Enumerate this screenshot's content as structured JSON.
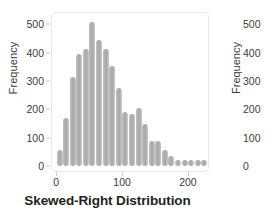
{
  "chart_data": {
    "type": "bar",
    "title": "Skewed-Right Distribution",
    "xlabel": "",
    "ylabel": "Frequency",
    "xlim": [
      -8,
      232
    ],
    "ylim": [
      0,
      530
    ],
    "grid": false,
    "legend": null,
    "bin_width": 10,
    "x": [
      5,
      15,
      25,
      35,
      45,
      55,
      65,
      75,
      85,
      95,
      105,
      115,
      125,
      135,
      145,
      155,
      165,
      175,
      185,
      195,
      205,
      215,
      225
    ],
    "values": [
      55,
      168,
      315,
      395,
      415,
      510,
      445,
      415,
      355,
      275,
      190,
      185,
      205,
      148,
      88,
      88,
      55,
      35,
      22,
      15,
      15,
      15,
      15
    ],
    "x_ticks": [
      {
        "value": 0,
        "label": "0"
      },
      {
        "value": 100,
        "label": "100"
      },
      {
        "value": 200,
        "label": "200"
      }
    ],
    "y_ticks": [
      {
        "value": 0,
        "label": "0"
      },
      {
        "value": 100,
        "label": "100"
      },
      {
        "value": 200,
        "label": "200"
      },
      {
        "value": 300,
        "label": "300"
      },
      {
        "value": 400,
        "label": "400"
      },
      {
        "value": 500,
        "label": "500"
      }
    ],
    "bar_color": "#b3b3b3",
    "frame_color": "#e8e8e8",
    "text_color": "#3c3c3c",
    "title_color": "#231f20"
  },
  "chart_data_secondary": {
    "type": "bar",
    "ylabel": "Frequency",
    "clipped": true,
    "y_ticks": [
      {
        "value": 500,
        "label": "500"
      },
      {
        "value": 400,
        "label": "400"
      },
      {
        "value": 300,
        "label": "300"
      },
      {
        "value": 200,
        "label": "200"
      },
      {
        "value": 100,
        "label": "100"
      },
      {
        "value": 0,
        "label": "0"
      }
    ]
  }
}
